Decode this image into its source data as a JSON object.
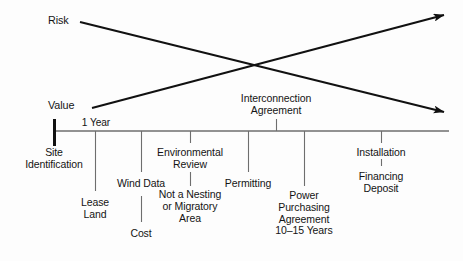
{
  "diagram": {
    "type": "timeline-with-trend-arrows",
    "background_color": "#fdfdfd",
    "line_color": "#111111",
    "axis_color": "#6e6e6e",
    "trend_arrows": [
      {
        "name": "risk-arrow",
        "label": "Risk",
        "direction": "descending",
        "start": [
          80,
          22
        ],
        "end": [
          447,
          113
        ],
        "meaning": "Risk decreases over the project timeline"
      },
      {
        "name": "value-arrow",
        "label": "Value",
        "direction": "ascending",
        "start": [
          92,
          108
        ],
        "end": [
          447,
          14
        ],
        "meaning": "Value increases over the project timeline"
      }
    ],
    "axis": {
      "name": "project-timeline-axis",
      "y": 131,
      "x_start": 54,
      "x_end": 449,
      "origin_marker": "thick-vertical-bar",
      "interval_label": "1 Year",
      "interval_label_x": 96,
      "interval_label_y": 117
    },
    "milestones_above": [
      {
        "name": "interconnection-agreement",
        "text": "Interconnection\nAgreement",
        "x": 276,
        "text_y": 94,
        "tick_top": 119,
        "tick_bottom": 131
      }
    ],
    "milestones_below": [
      {
        "name": "site-identification",
        "text": "Site\nIdentification",
        "x": 54,
        "text_y": 146,
        "tick_top": 131,
        "tick_bottom": 131
      },
      {
        "name": "lease-land",
        "text": "Lease\nLand",
        "x": 95,
        "text_y": 196,
        "tick_top": 131,
        "tick_bottom": 191
      },
      {
        "name": "wind-data",
        "text": "Wind Data",
        "x": 141,
        "text_y": 177,
        "tick_top": 131,
        "tick_bottom": 172
      },
      {
        "name": "cost",
        "text": "Cost",
        "x": 141,
        "text_y": 227,
        "tick_top": 196,
        "tick_bottom": 222
      },
      {
        "name": "environmental-review",
        "text": "Environmental\nReview",
        "x": 190,
        "text_y": 146,
        "tick_top": 131,
        "tick_bottom": 143
      },
      {
        "name": "not-a-nesting-or-migratory-area",
        "text": "Not a Nesting\nor Migratory\nArea",
        "x": 190,
        "text_y": 188,
        "tick_top": 172,
        "tick_bottom": 186
      },
      {
        "name": "permitting",
        "text": "Permitting",
        "x": 248,
        "text_y": 177,
        "tick_top": 131,
        "tick_bottom": 172
      },
      {
        "name": "power-purchasing-agreement",
        "text": "Power\nPurchasing\nAgreement\n10–15 Years",
        "x": 304,
        "text_y": 190,
        "tick_top": 131,
        "tick_bottom": 186
      },
      {
        "name": "installation",
        "text": "Installation",
        "x": 381,
        "text_y": 146,
        "tick_top": 131,
        "tick_bottom": 143
      },
      {
        "name": "financing-deposit",
        "text": "Financing\nDeposit",
        "x": 381,
        "text_y": 170,
        "tick_top": 159,
        "tick_bottom": 166
      }
    ]
  }
}
